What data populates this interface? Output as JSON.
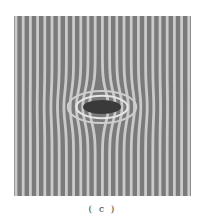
{
  "figure": {
    "panel_label": "( c )",
    "fringe_period_px": 7.2,
    "fringe_count": 24,
    "colors": {
      "background": "#7a7a7a",
      "fringe_light": "#d8d8d8",
      "defect": "#3a3a3a"
    },
    "defect": {
      "cx": 88,
      "cy": 91,
      "rx": 19,
      "ry": 7
    }
  }
}
